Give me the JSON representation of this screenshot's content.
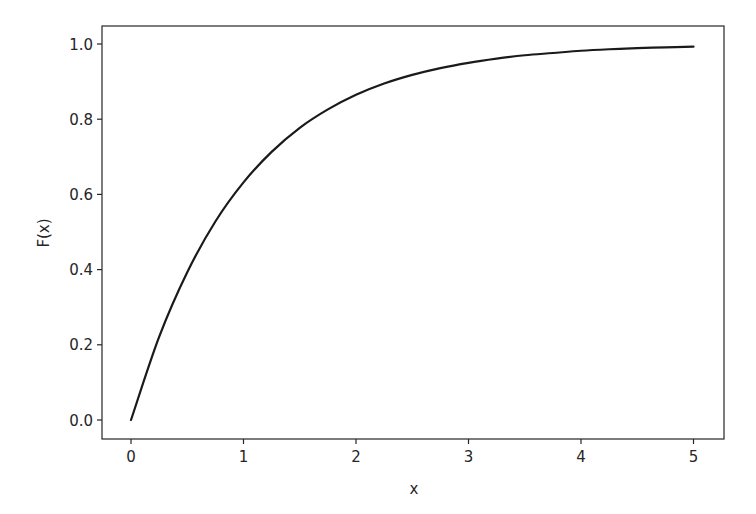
{
  "chart_data": {
    "type": "line",
    "title": "",
    "xlabel": "x",
    "ylabel": "F(x)",
    "xlim": [
      -0.25,
      5.25
    ],
    "ylim": [
      -0.05,
      1.05
    ],
    "grid": false,
    "legend": null,
    "x_ticks": [
      0,
      1,
      2,
      3,
      4,
      5
    ],
    "x_tick_labels": [
      "0",
      "1",
      "2",
      "3",
      "4",
      "5"
    ],
    "y_ticks": [
      0.0,
      0.2,
      0.4,
      0.6,
      0.8,
      1.0
    ],
    "y_tick_labels": [
      "0.0",
      "0.2",
      "0.4",
      "0.6",
      "0.8",
      "1.0"
    ],
    "series": [
      {
        "name": "F(x) = 1 - exp(-x)",
        "color": "#1a1a1a",
        "x": [
          0,
          0.25,
          0.5,
          0.75,
          1.0,
          1.25,
          1.5,
          1.75,
          2.0,
          2.25,
          2.5,
          2.75,
          3.0,
          3.25,
          3.5,
          3.75,
          4.0,
          4.25,
          4.5,
          4.75,
          5.0
        ],
        "y": [
          0.0,
          0.221,
          0.393,
          0.528,
          0.632,
          0.713,
          0.777,
          0.826,
          0.865,
          0.895,
          0.918,
          0.936,
          0.95,
          0.961,
          0.97,
          0.976,
          0.982,
          0.986,
          0.989,
          0.991,
          0.993
        ]
      }
    ]
  },
  "colors": {
    "line": "#1a1a1a",
    "axes": "#262626",
    "background": "#ffffff"
  }
}
